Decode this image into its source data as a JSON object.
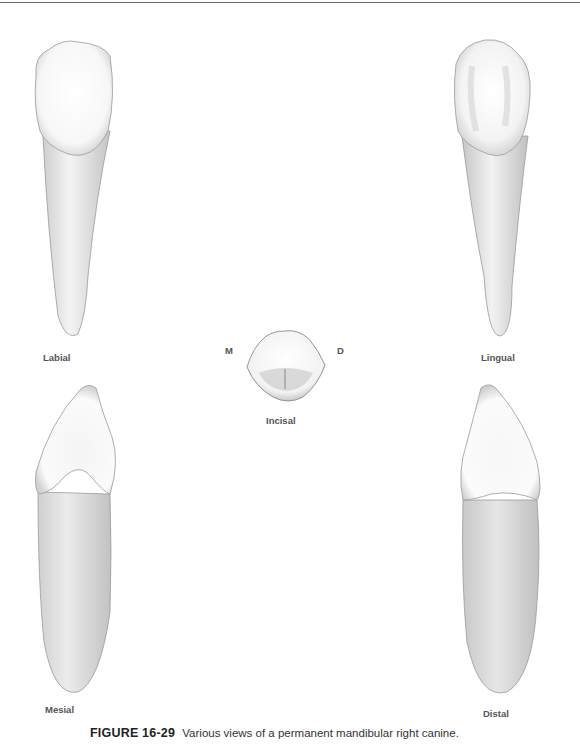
{
  "figure": {
    "number": "FIGURE 16-29",
    "caption": "Various views of a permanent mandibular right canine."
  },
  "views": {
    "labial": "Labial",
    "lingual": "Lingual",
    "incisal": "Incisal",
    "mesial": "Mesial",
    "distal": "Distal"
  },
  "orientation": {
    "mesial_marker": "M",
    "distal_marker": "D"
  },
  "colors": {
    "outline": "#8a8a8a",
    "shade": "#d6d6d6",
    "label": "#555555"
  }
}
